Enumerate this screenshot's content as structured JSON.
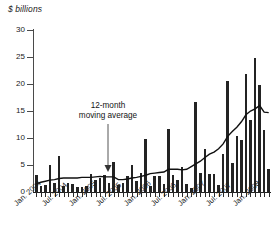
{
  "chart_data": {
    "type": "bar",
    "title": "$ billions",
    "xlabel": "",
    "ylabel": "$ billions",
    "ylim": [
      0,
      30
    ],
    "yticks": [
      0,
      5,
      10,
      15,
      20,
      25,
      30
    ],
    "ytick_labels": [
      "0",
      "5",
      "10",
      "15",
      "20",
      "25",
      "30"
    ],
    "grid": false,
    "legend": "none",
    "annotation": {
      "line1": "12-month",
      "line2": "moving average",
      "points_to": "Jan. 2005"
    },
    "xtick_labels": [
      "Jan. 2004",
      "Jul. 2004",
      "Jan. 2005",
      "Jul. 2005",
      "Jan. 2006",
      "Jul. 2006",
      "Jan. 2007",
      "Jul. 2007",
      "Jan. 2008"
    ],
    "xtick_positions": [
      0,
      6,
      12,
      18,
      24,
      30,
      36,
      42,
      48
    ],
    "categories": [
      "Jan. 2004",
      "Feb. 2004",
      "Mar. 2004",
      "Apr. 2004",
      "May 2004",
      "Jun. 2004",
      "Jul. 2004",
      "Aug. 2004",
      "Sep. 2004",
      "Oct. 2004",
      "Nov. 2004",
      "Dec. 2004",
      "Jan. 2005",
      "Feb. 2005",
      "Mar. 2005",
      "Apr. 2005",
      "May 2005",
      "Jun. 2005",
      "Jul. 2005",
      "Aug. 2005",
      "Sep. 2005",
      "Oct. 2005",
      "Nov. 2005",
      "Dec. 2005",
      "Jan. 2006",
      "Feb. 2006",
      "Mar. 2006",
      "Apr. 2006",
      "May 2006",
      "Jun. 2006",
      "Jul. 2006",
      "Aug. 2006",
      "Sep. 2006",
      "Oct. 2006",
      "Nov. 2006",
      "Dec. 2006",
      "Jan. 2007",
      "Feb. 2007",
      "Mar. 2007",
      "Apr. 2007",
      "May 2007",
      "Jun. 2007",
      "Jul. 2007",
      "Aug. 2007",
      "Sep. 2007",
      "Oct. 2007",
      "Nov. 2007",
      "Dec. 2007",
      "Jan. 2008",
      "Feb. 2008",
      "Mar. 2008",
      "Apr. 2008"
    ],
    "series": [
      {
        "name": "Monthly issuance",
        "values": [
          3.1,
          1.2,
          1.3,
          5.0,
          1.6,
          6.7,
          1.2,
          1.6,
          1.4,
          0.9,
          1.0,
          1.1,
          3.4,
          2.2,
          2.6,
          3.1,
          1.6,
          5.6,
          1.3,
          1.7,
          3.0,
          5.0,
          2.1,
          3.5,
          9.9,
          1.1,
          2.9,
          3.0,
          1.4,
          11.7,
          3.1,
          2.2,
          4.6,
          1.5,
          0.7,
          16.6,
          3.5,
          7.9,
          3.3,
          3.3,
          1.3,
          7.0,
          20.6,
          5.3,
          10.3,
          9.6,
          21.8,
          13.4,
          24.9,
          19.8,
          11.4,
          4.3
        ]
      },
      {
        "name": "12-month moving average",
        "values": [
          1.5,
          1.8,
          2.0,
          2.2,
          2.3,
          2.5,
          2.6,
          2.6,
          2.6,
          2.6,
          2.7,
          2.7,
          2.7,
          2.8,
          2.9,
          2.8,
          2.8,
          2.8,
          2.3,
          2.3,
          2.4,
          2.6,
          2.7,
          2.9,
          3.1,
          3.4,
          3.5,
          3.6,
          3.7,
          4.2,
          4.2,
          4.2,
          4.1,
          4.2,
          4.7,
          5.2,
          5.7,
          6.4,
          7.0,
          7.4,
          8.0,
          8.9,
          10.3,
          11.2,
          12.0,
          13.0,
          14.3,
          15.0,
          15.4,
          16.0,
          14.8,
          14.7
        ]
      }
    ]
  }
}
